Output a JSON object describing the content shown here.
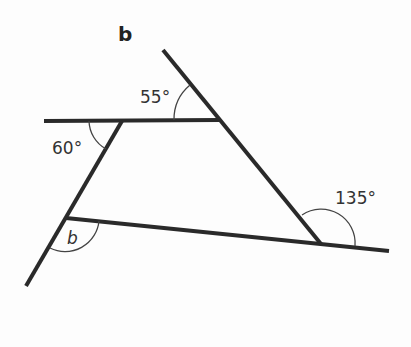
{
  "figure": {
    "part_label": "b",
    "angles": {
      "top_right": "55°",
      "top_left": "60°",
      "bottom_right": "135°",
      "bottom_left_unknown": "b"
    }
  },
  "colors": {
    "line": "#2a2a2a",
    "arc": "#444444",
    "background": "#fdfdfd"
  }
}
